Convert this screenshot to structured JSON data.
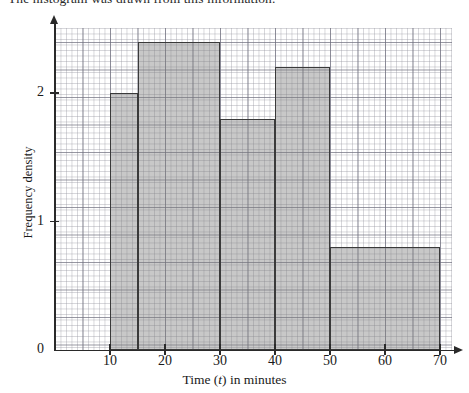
{
  "intro": {
    "text": "The histogram was drawn from this information."
  },
  "chart_data": {
    "type": "bar",
    "title": "",
    "subtitle": "",
    "xlabel_prefix": "Time (",
    "xlabel_var": "t",
    "xlabel_suffix": ") in minutes",
    "xlabel": "Time (t) in minutes",
    "ylabel": "Frequency density",
    "xlim": [
      0,
      75
    ],
    "ylim": [
      0,
      2.5
    ],
    "grid": true,
    "grid_style": "graph-paper",
    "legend": "none",
    "xticks": [
      10,
      20,
      30,
      40,
      50,
      60,
      70
    ],
    "xtick_labels": [
      "10",
      "20",
      "30",
      "40",
      "50",
      "60",
      "70"
    ],
    "yticks": [
      0,
      1,
      2
    ],
    "ytick_labels": [
      "0",
      "1",
      "2"
    ],
    "bar_fill_color": "#8c8c8c",
    "bar_edge_color": "#3a3a3a",
    "bins": [
      {
        "label": "10 - 15",
        "x_start": 10,
        "x_end": 15,
        "frequency_density": 2.0
      },
      {
        "label": "15 - 30",
        "x_start": 15,
        "x_end": 30,
        "frequency_density": 2.4
      },
      {
        "label": "30 - 40",
        "x_start": 30,
        "x_end": 40,
        "frequency_density": 1.8
      },
      {
        "label": "40 - 50",
        "x_start": 40,
        "x_end": 50,
        "frequency_density": 2.2
      },
      {
        "label": "50 - 70",
        "x_start": 50,
        "x_end": 70,
        "frequency_density": 0.8
      }
    ]
  }
}
